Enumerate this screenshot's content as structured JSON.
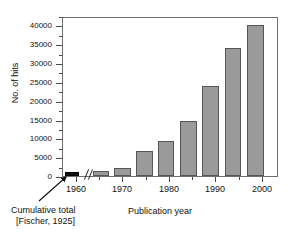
{
  "chart_data": {
    "type": "bar",
    "title": "",
    "xlabel": "Publication year",
    "ylabel": "No. of hits",
    "ylim": [
      0,
      42500
    ],
    "yticks": [
      0,
      5000,
      10000,
      15000,
      20000,
      25000,
      30000,
      35000,
      40000
    ],
    "ytick_labels": [
      "0",
      "5000",
      "10000",
      "15000",
      "20000",
      "25000",
      "30000",
      "35000",
      "40000"
    ],
    "xlim": [
      1957,
      2003.5
    ],
    "xticks": [
      1960,
      1970,
      1980,
      1990,
      2000
    ],
    "xtick_labels": [
      "1960",
      "1970",
      "1980",
      "1990",
      "2000"
    ],
    "grid": false,
    "legend": null,
    "axis_break": {
      "marker": "//",
      "after_category": "Cumulative total",
      "note": "x-axis break between cumulative-total bar and 1965 bar"
    },
    "categories": [
      "Cumulative total",
      "1965",
      "1970",
      "1975",
      "1980",
      "1985",
      "1990",
      "1995",
      "2000"
    ],
    "values": [
      600,
      1200,
      2200,
      6600,
      9400,
      14500,
      23800,
      34000,
      40100
    ],
    "bars": [
      {
        "label": "Cumulative total",
        "value": 600,
        "color": "#101010",
        "x_center": 1959.0,
        "width": 3.0
      },
      {
        "label": "1965",
        "value": 1200,
        "color": "#9a9a9a",
        "x_center": 1965.2,
        "width": 3.6
      },
      {
        "label": "1970",
        "value": 2200,
        "color": "#9a9a9a",
        "x_center": 1969.8,
        "width": 3.6
      },
      {
        "label": "1975",
        "value": 6600,
        "color": "#9a9a9a",
        "x_center": 1974.5,
        "width": 3.6
      },
      {
        "label": "1980",
        "value": 9400,
        "color": "#9a9a9a",
        "x_center": 1979.2,
        "width": 3.6
      },
      {
        "label": "1985",
        "value": 14500,
        "color": "#9a9a9a",
        "x_center": 1984.0,
        "width": 3.6
      },
      {
        "label": "1990",
        "value": 23800,
        "color": "#9a9a9a",
        "x_center": 1988.8,
        "width": 3.6
      },
      {
        "label": "1995",
        "value": 34000,
        "color": "#9a9a9a",
        "x_center": 1993.6,
        "width": 3.6
      },
      {
        "label": "2000",
        "value": 40100,
        "color": "#9a9a9a",
        "x_center": 1998.4,
        "width": 3.6
      }
    ],
    "annotations": [
      {
        "name": "cumulative-total-annotation",
        "lines": [
          "Cumulative total",
          "[Fischer, 1925]"
        ],
        "points_to": "Cumulative total"
      }
    ],
    "colors": {
      "bar_gray_fill": "#9a9a9a",
      "bar_gray_edge": "#565656",
      "bar_black_fill": "#101010",
      "frame": "#6e6e6e",
      "text": "#111111"
    }
  },
  "axes": {
    "y_title": "No. of hits",
    "x_title": "Publication year"
  },
  "caption": {
    "line_1": "Cumulative total",
    "line_2": "[Fischer, 1925]"
  }
}
